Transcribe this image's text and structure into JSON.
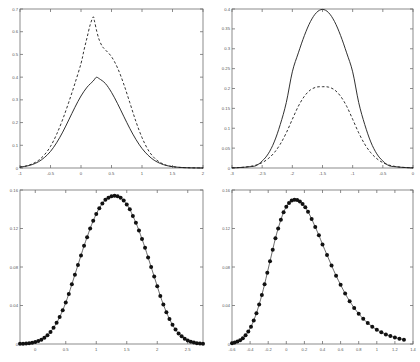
{
  "figure": {
    "background": "#ffffff",
    "axis_color": "#6f6f6f",
    "curve_color": "#1a1a1a",
    "marker_color": "#111111",
    "layout": "2x2 grid of line plots"
  },
  "chart_data": [
    {
      "id": "top-left",
      "type": "line",
      "title": "",
      "xlabel": "",
      "ylabel": "",
      "xlim": [
        -1,
        2
      ],
      "ylim": [
        0,
        0.7
      ],
      "xticks": [
        -1,
        -0.5,
        0,
        0.5,
        1,
        1.5,
        2
      ],
      "xticklabels": [
        "-1",
        "-0.5",
        "0",
        "0.5",
        "1",
        "1.5",
        "2"
      ],
      "yticks": [
        0,
        0.1,
        0.2,
        0.3,
        0.4,
        0.5,
        0.6,
        0.7
      ],
      "yticklabels": [
        "0",
        "0.1",
        "0.2",
        "0.3",
        "0.4",
        "0.5",
        "0.6",
        "0.7"
      ],
      "grid": false,
      "legend": "none",
      "series": [
        {
          "name": "solid",
          "style": "solid",
          "marker": "none",
          "x": [
            -1,
            -0.9,
            -0.8,
            -0.7,
            -0.6,
            -0.5,
            -0.4,
            -0.3,
            -0.2,
            -0.1,
            0,
            0.1,
            0.2,
            0.25,
            0.3,
            0.4,
            0.5,
            0.6,
            0.7,
            0.8,
            0.9,
            1,
            1.1,
            1.2,
            1.3,
            1.4,
            1.5,
            1.6,
            1.7,
            1.8,
            1.9,
            2
          ],
          "y": [
            0.004,
            0.008,
            0.015,
            0.027,
            0.046,
            0.073,
            0.111,
            0.158,
            0.212,
            0.267,
            0.317,
            0.356,
            0.383,
            0.399,
            0.393,
            0.372,
            0.333,
            0.283,
            0.228,
            0.174,
            0.126,
            0.086,
            0.056,
            0.034,
            0.02,
            0.011,
            0.006,
            0.003,
            0.0015,
            0.0007,
            0.0003,
            0.0001
          ]
        },
        {
          "name": "dashed",
          "style": "dashed",
          "marker": "none",
          "x": [
            -1,
            -0.9,
            -0.8,
            -0.7,
            -0.6,
            -0.5,
            -0.4,
            -0.3,
            -0.2,
            -0.1,
            0,
            0.05,
            0.1,
            0.15,
            0.2,
            0.22,
            0.26,
            0.3,
            0.35,
            0.4,
            0.5,
            0.6,
            0.7,
            0.8,
            0.9,
            1,
            1.1,
            1.2,
            1.3,
            1.4,
            1.5,
            1.6,
            1.8,
            2
          ],
          "y": [
            0.004,
            0.009,
            0.018,
            0.033,
            0.058,
            0.095,
            0.148,
            0.214,
            0.29,
            0.372,
            0.46,
            0.52,
            0.575,
            0.63,
            0.665,
            0.648,
            0.6,
            0.563,
            0.535,
            0.52,
            0.49,
            0.44,
            0.37,
            0.288,
            0.205,
            0.134,
            0.08,
            0.045,
            0.024,
            0.012,
            0.006,
            0.003,
            0.0008,
            0.0002
          ]
        }
      ]
    },
    {
      "id": "top-right",
      "type": "line",
      "title": "",
      "xlabel": "",
      "ylabel": "",
      "xlim": [
        -3,
        0
      ],
      "ylim": [
        0,
        0.4
      ],
      "xticks": [
        -3,
        -2.5,
        -2,
        -1.5,
        -1,
        -0.5,
        0
      ],
      "xticklabels": [
        "-3",
        "-2.5",
        "-2",
        "-1.5",
        "-1",
        "-0.5",
        "0"
      ],
      "yticks": [
        0,
        0.05,
        0.1,
        0.15,
        0.2,
        0.25,
        0.3,
        0.35,
        0.4
      ],
      "yticklabels": [
        "0",
        "0.05",
        "0.1",
        "0.15",
        "0.2",
        "0.25",
        "0.3",
        "0.35",
        "0.4"
      ],
      "grid": false,
      "legend": "none",
      "series": [
        {
          "name": "solid",
          "style": "solid",
          "marker": "none",
          "x": [
            -3,
            -2.9,
            -2.8,
            -2.7,
            -2.6,
            -2.5,
            -2.4,
            -2.3,
            -2.2,
            -2.1,
            -2,
            -1.9,
            -1.8,
            -1.7,
            -1.6,
            -1.5,
            -1.4,
            -1.3,
            -1.2,
            -1.1,
            -1,
            -0.9,
            -0.8,
            -0.7,
            -0.6,
            -0.5,
            -0.4,
            -0.3,
            -0.2,
            -0.1,
            0
          ],
          "y": [
            0.0004,
            0.0009,
            0.0018,
            0.0033,
            0.006,
            0.0175,
            0.0356,
            0.0656,
            0.1095,
            0.1647,
            0.242,
            0.2897,
            0.3332,
            0.3683,
            0.391,
            0.39894,
            0.391,
            0.3683,
            0.3332,
            0.2897,
            0.242,
            0.1647,
            0.1095,
            0.0656,
            0.0356,
            0.0175,
            0.006,
            0.0033,
            0.0018,
            0.0009,
            0.0004
          ]
        },
        {
          "name": "dashed",
          "style": "dashed",
          "marker": "none",
          "x": [
            -3,
            -2.9,
            -2.8,
            -2.7,
            -2.6,
            -2.5,
            -2.4,
            -2.3,
            -2.2,
            -2.1,
            -2,
            -1.9,
            -1.8,
            -1.7,
            -1.6,
            -1.5,
            -1.4,
            -1.3,
            -1.2,
            -1.1,
            -1,
            -0.9,
            -0.8,
            -0.7,
            -0.6,
            -0.5,
            -0.4,
            -0.3,
            -0.2,
            -0.1,
            0
          ],
          "y": [
            0.0005,
            0.001,
            0.002,
            0.004,
            0.0075,
            0.0135,
            0.0235,
            0.0385,
            0.06,
            0.0885,
            0.1225,
            0.1555,
            0.1805,
            0.1965,
            0.2035,
            0.2045,
            0.2035,
            0.1965,
            0.1805,
            0.1555,
            0.1225,
            0.0885,
            0.06,
            0.0385,
            0.0235,
            0.0135,
            0.0075,
            0.004,
            0.002,
            0.001,
            0.0005
          ]
        }
      ]
    },
    {
      "id": "bottom-left",
      "type": "line",
      "title": "",
      "xlabel": "",
      "ylabel": "",
      "xlim": [
        -0.25,
        2.75
      ],
      "ylim": [
        0,
        0.16
      ],
      "xticks": [
        0,
        0.5,
        1,
        1.5,
        2,
        2.5
      ],
      "xticklabels": [
        "0",
        "0.5",
        "1",
        "1.5",
        "2",
        "2.5"
      ],
      "yticks": [
        0,
        0.04,
        0.08,
        0.12,
        0.16
      ],
      "yticklabels": [
        "0",
        "0.04",
        "0.08",
        "0.12",
        "0.16"
      ],
      "grid": false,
      "legend": "none",
      "series": [
        {
          "name": "markers",
          "style": "solid",
          "marker": "filled-circle",
          "x": [
            -0.25,
            -0.2,
            -0.15,
            -0.1,
            -0.05,
            0,
            0.05,
            0.1,
            0.15,
            0.2,
            0.25,
            0.3,
            0.35,
            0.4,
            0.45,
            0.5,
            0.55,
            0.6,
            0.65,
            0.7,
            0.75,
            0.8,
            0.85,
            0.9,
            0.95,
            1,
            1.05,
            1.1,
            1.15,
            1.2,
            1.25,
            1.3,
            1.35,
            1.4,
            1.45,
            1.5,
            1.55,
            1.6,
            1.65,
            1.7,
            1.75,
            1.8,
            1.85,
            1.9,
            1.95,
            2,
            2.05,
            2.1,
            2.15,
            2.2,
            2.25,
            2.3,
            2.35,
            2.4,
            2.45,
            2.5,
            2.55,
            2.6,
            2.65,
            2.7,
            2.75
          ],
          "y": [
            0.0002,
            0.0003,
            0.0005,
            0.0008,
            0.0013,
            0.002,
            0.003,
            0.0045,
            0.0065,
            0.009,
            0.0125,
            0.017,
            0.022,
            0.028,
            0.035,
            0.043,
            0.052,
            0.062,
            0.072,
            0.082,
            0.092,
            0.102,
            0.111,
            0.12,
            0.128,
            0.135,
            0.141,
            0.146,
            0.15,
            0.152,
            0.1535,
            0.154,
            0.1535,
            0.152,
            0.149,
            0.145,
            0.14,
            0.133,
            0.126,
            0.118,
            0.109,
            0.1,
            0.09,
            0.08,
            0.07,
            0.06,
            0.05,
            0.041,
            0.033,
            0.026,
            0.02,
            0.015,
            0.011,
            0.008,
            0.0055,
            0.0037,
            0.0024,
            0.0015,
            0.0009,
            0.0005,
            0.0003
          ]
        }
      ]
    },
    {
      "id": "bottom-right",
      "type": "line",
      "title": "",
      "xlabel": "",
      "ylabel": "",
      "xlim": [
        -0.6,
        1.4
      ],
      "ylim": [
        0,
        0.16
      ],
      "xticks": [
        -0.6,
        -0.4,
        -0.2,
        0,
        0.2,
        0.4,
        0.6,
        0.8,
        1,
        1.2,
        1.4
      ],
      "xticklabels": [
        "-0.6",
        "-0.4",
        "-0.2",
        "0",
        "0.2",
        "0.4",
        "0.6",
        "0.8",
        "1",
        "1.2",
        "1.4"
      ],
      "yticks": [
        0,
        0.04,
        0.08,
        0.12,
        0.16
      ],
      "yticklabels": [
        "0",
        "0.04",
        "0.08",
        "0.12",
        "0.16"
      ],
      "grid": false,
      "legend": "none",
      "series": [
        {
          "name": "markers",
          "style": "solid",
          "marker": "filled-circle",
          "x": [
            -0.6,
            -0.57,
            -0.54,
            -0.51,
            -0.48,
            -0.45,
            -0.42,
            -0.39,
            -0.36,
            -0.33,
            -0.3,
            -0.27,
            -0.24,
            -0.21,
            -0.18,
            -0.15,
            -0.12,
            -0.09,
            -0.06,
            -0.03,
            0,
            0.03,
            0.06,
            0.09,
            0.12,
            0.15,
            0.18,
            0.21,
            0.24,
            0.28,
            0.32,
            0.36,
            0.4,
            0.45,
            0.5,
            0.55,
            0.6,
            0.65,
            0.7,
            0.75,
            0.8,
            0.85,
            0.9,
            0.95,
            1,
            1.05,
            1.1,
            1.15,
            1.2,
            1.25,
            1.3
          ],
          "y": [
            0.0008,
            0.0015,
            0.0025,
            0.004,
            0.006,
            0.009,
            0.013,
            0.018,
            0.0245,
            0.032,
            0.041,
            0.051,
            0.062,
            0.074,
            0.086,
            0.098,
            0.11,
            0.12,
            0.129,
            0.137,
            0.1425,
            0.1465,
            0.149,
            0.15,
            0.1495,
            0.148,
            0.1455,
            0.142,
            0.1375,
            0.13,
            0.1215,
            0.113,
            0.1035,
            0.0925,
            0.0815,
            0.071,
            0.0615,
            0.0525,
            0.0445,
            0.0375,
            0.0315,
            0.0262,
            0.0218,
            0.018,
            0.0148,
            0.0122,
            0.01,
            0.0082,
            0.0067,
            0.0055,
            0.0045
          ]
        }
      ]
    }
  ]
}
